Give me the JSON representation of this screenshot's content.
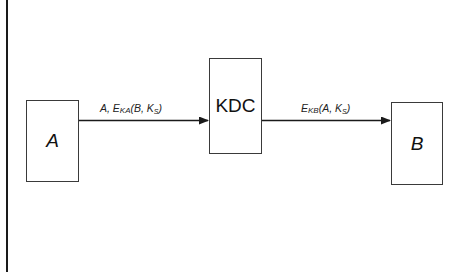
{
  "diagram": {
    "title": "",
    "type": "protocol-flow",
    "nodes": [
      {
        "id": "A",
        "label": "A",
        "style": "italic"
      },
      {
        "id": "KDC",
        "label": "KDC",
        "style": "normal"
      },
      {
        "id": "B",
        "label": "B",
        "style": "italic"
      }
    ],
    "edges": [
      {
        "from": "A",
        "to": "KDC",
        "label_parts": {
          "prefix": "A, E",
          "key_sub": "KA",
          "mid": "(B, K",
          "session_sub": "S",
          "suffix": ")"
        },
        "label_text": "A, E_KA(B, K_S)"
      },
      {
        "from": "KDC",
        "to": "B",
        "label_parts": {
          "prefix": "E",
          "key_sub": "KB",
          "mid": "(A, K",
          "session_sub": "S",
          "suffix": ")"
        },
        "label_text": "E_KB(A, K_S)"
      }
    ],
    "colors": {
      "stroke": "#3a3a3a",
      "text": "#111111",
      "background": "#ffffff"
    }
  }
}
